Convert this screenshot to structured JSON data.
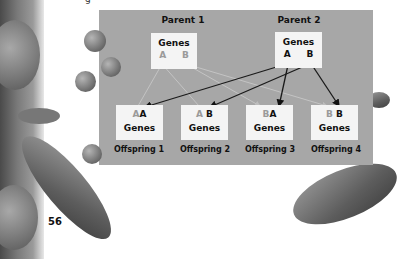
{
  "header_fragment": "g",
  "page_number": "56",
  "diagram": {
    "parents": [
      {
        "label": "Parent 1",
        "genes_label": "Genes",
        "alleles": [
          "A",
          "B"
        ],
        "allele_shade": "light"
      },
      {
        "label": "Parent 2",
        "genes_label": "Genes",
        "alleles": [
          "A",
          "B"
        ],
        "allele_shade": "dark"
      }
    ],
    "offspring": [
      {
        "label": "Offspring 1",
        "genes_label": "Genes",
        "from_parent1": "A",
        "from_parent2": "A"
      },
      {
        "label": "Offspring 2",
        "genes_label": "Genes",
        "from_parent1": "A",
        "from_parent2": "B"
      },
      {
        "label": "Offspring 3",
        "genes_label": "Genes",
        "from_parent1": "B",
        "from_parent2": "A"
      },
      {
        "label": "Offspring 4",
        "genes_label": "Genes",
        "from_parent1": "B",
        "from_parent2": "B"
      }
    ],
    "connections": [
      {
        "from": "Parent 1 A",
        "to": "Offspring 1",
        "style": "light-line"
      },
      {
        "from": "Parent 1 A",
        "to": "Offspring 2",
        "style": "light-line"
      },
      {
        "from": "Parent 1 B",
        "to": "Offspring 3",
        "style": "light-line"
      },
      {
        "from": "Parent 1 B",
        "to": "Offspring 4",
        "style": "light-line"
      },
      {
        "from": "Parent 2 A",
        "to": "Offspring 1",
        "style": "dark-arrow"
      },
      {
        "from": "Parent 2 B",
        "to": "Offspring 2",
        "style": "dark-arrow"
      },
      {
        "from": "Parent 2 A",
        "to": "Offspring 3",
        "style": "dark-arrow"
      },
      {
        "from": "Parent 2 B",
        "to": "Offspring 4",
        "style": "dark-arrow"
      }
    ]
  },
  "colors": {
    "panel": "#a7a7a7",
    "box": "#f4f4f4",
    "light_allele": "#9a9a9a",
    "dark_allele": "#111111"
  }
}
